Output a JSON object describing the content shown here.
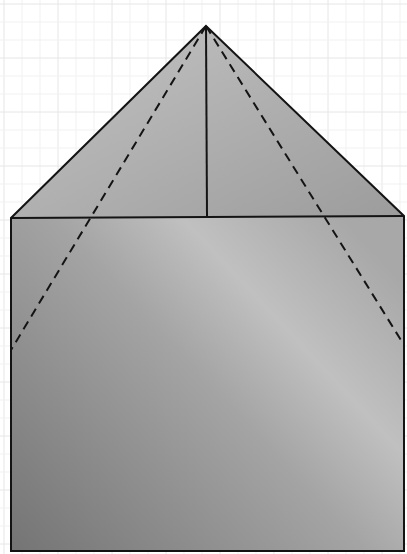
{
  "canvas": {
    "width": 407,
    "height": 554,
    "background": "#ffffff"
  },
  "grid": {
    "minor_spacing": 18,
    "major_every": 3,
    "minor_color": "#f1f1f1",
    "major_color": "#e6e6e6"
  },
  "shape": {
    "description": "Folded paper: rectangle with triangular roof, fold lines",
    "apex": [
      206,
      26
    ],
    "roof_left": [
      11,
      218
    ],
    "roof_right": [
      404,
      216
    ],
    "bottom_left": [
      11,
      551
    ],
    "bottom_right": [
      404,
      551
    ],
    "roof_fill_light": "#c4c4c4",
    "roof_fill_dark": "#9c9c9c",
    "body_fill_dark": "#747474",
    "body_fill_mid": "#9a9a9a",
    "body_fill_light": "#c0c0c0",
    "stroke": "#141414",
    "stroke_width": 2
  },
  "lines": {
    "center_fold": {
      "from": [
        206,
        26
      ],
      "to": [
        207,
        217
      ],
      "style": "solid"
    },
    "base_fold": {
      "from": [
        11,
        218
      ],
      "to": [
        404,
        216
      ],
      "style": "solid"
    },
    "left_dashed": {
      "from": [
        206,
        26
      ],
      "to": [
        11,
        350
      ],
      "style": "dashed",
      "dash": "9 6"
    },
    "right_dashed": {
      "from": [
        206,
        26
      ],
      "to": [
        404,
        345
      ],
      "style": "dashed",
      "dash": "9 6"
    }
  }
}
